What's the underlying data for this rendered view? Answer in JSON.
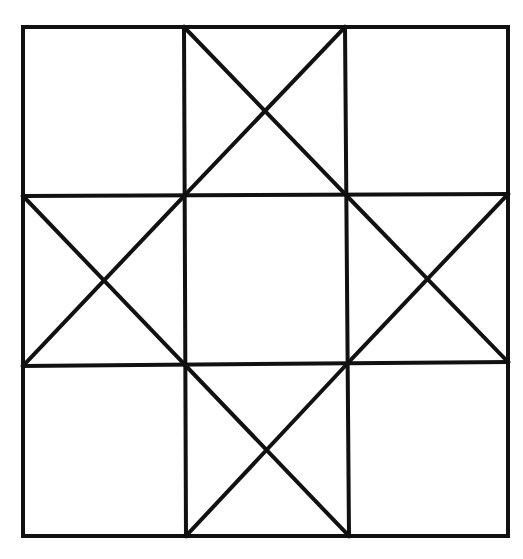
{
  "diagram": {
    "stroke_color": "#111111",
    "background_color": "#ffffff",
    "outer": {
      "left": 23,
      "top": 27,
      "right": 508,
      "bottom": 536
    },
    "grid": {
      "verticals": [
        {
          "x1": 184,
          "y1": 27,
          "x2": 186,
          "y2": 536
        },
        {
          "x1": 345,
          "y1": 27,
          "x2": 349,
          "y2": 536
        }
      ],
      "horizontals": [
        {
          "x1": 23,
          "y1": 196,
          "x2": 508,
          "y2": 194
        },
        {
          "x1": 23,
          "y1": 366,
          "x2": 508,
          "y2": 362
        }
      ]
    },
    "diagonals": [
      {
        "cell": "top-middle",
        "x1": 184,
        "y1": 27,
        "x2": 345,
        "y2": 194
      },
      {
        "cell": "top-middle",
        "x1": 345,
        "y1": 27,
        "x2": 184,
        "y2": 196
      },
      {
        "cell": "middle-left",
        "x1": 23,
        "y1": 196,
        "x2": 186,
        "y2": 366
      },
      {
        "cell": "middle-left",
        "x1": 184,
        "y1": 196,
        "x2": 23,
        "y2": 366
      },
      {
        "cell": "middle-right",
        "x1": 345,
        "y1": 194,
        "x2": 508,
        "y2": 362
      },
      {
        "cell": "middle-right",
        "x1": 508,
        "y1": 194,
        "x2": 347,
        "y2": 364
      },
      {
        "cell": "bottom-middle",
        "x1": 186,
        "y1": 366,
        "x2": 349,
        "y2": 536
      },
      {
        "cell": "bottom-middle",
        "x1": 347,
        "y1": 364,
        "x2": 186,
        "y2": 536
      }
    ]
  }
}
